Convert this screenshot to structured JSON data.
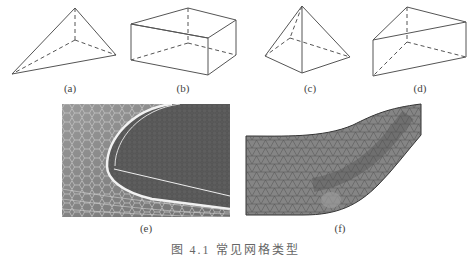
{
  "figure": {
    "labels": [
      "(a)",
      "(b)",
      "(c)",
      "(d)",
      "(e)",
      "(f)"
    ],
    "caption": "图 4.1   常见网格类型",
    "elements": [
      {
        "id": "a",
        "shape": "tetrahedron"
      },
      {
        "id": "b",
        "shape": "hexahedron"
      },
      {
        "id": "c",
        "shape": "pyramid"
      },
      {
        "id": "d",
        "shape": "wedge-prism"
      },
      {
        "id": "e",
        "shape": "structured-surface-mesh"
      },
      {
        "id": "f",
        "shape": "unstructured-channel-mesh"
      }
    ],
    "colors": {
      "line": "#555555",
      "mesh_bg_e": "#8a8a8a",
      "mesh_bg_f": "#7a7a7a"
    }
  }
}
